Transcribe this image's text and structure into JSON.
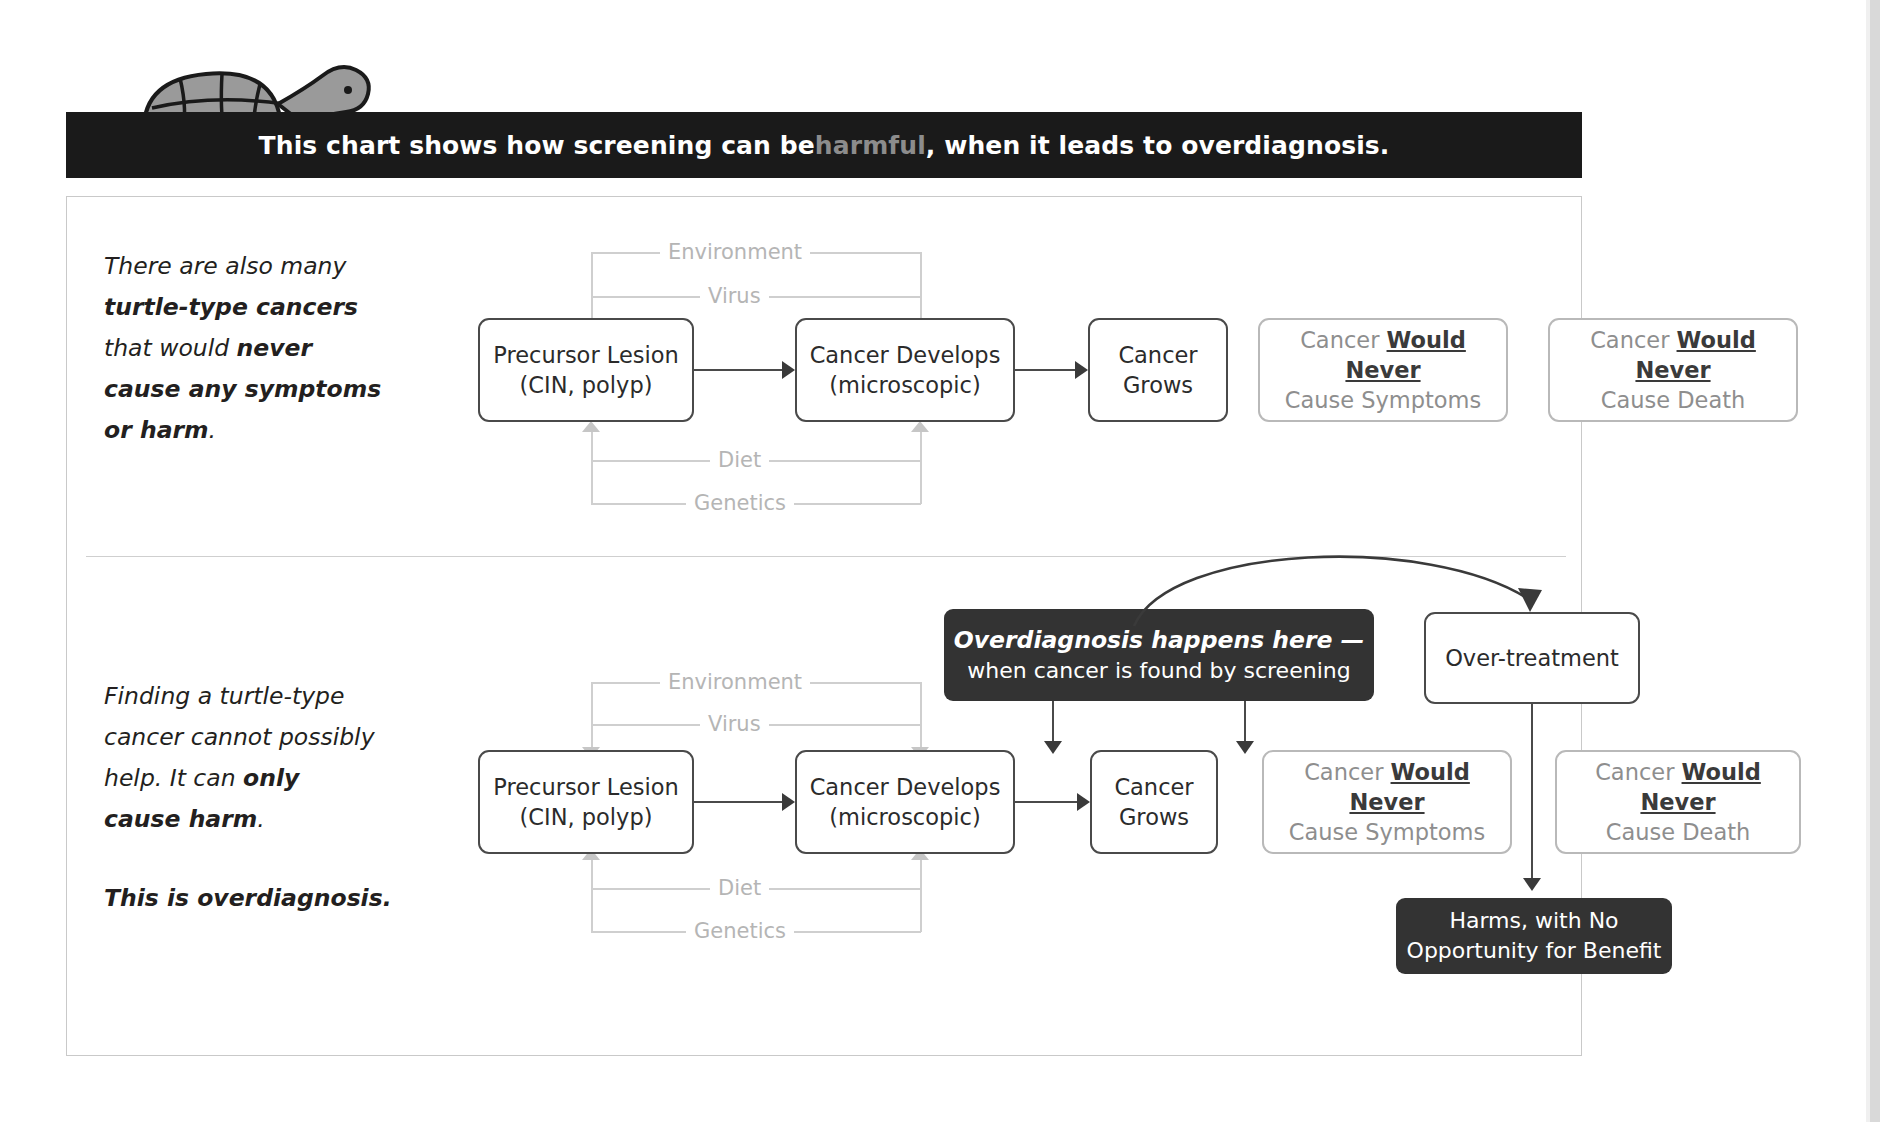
{
  "header": {
    "title_part1": "This chart shows how screening can be ",
    "title_highlight": "harmful",
    "title_part2": ", when it leads to overdiagnosis.",
    "highlight_color": "#8c8c8c",
    "bar_color": "#1a1a1a"
  },
  "mascot": {
    "name": "turtle-illustration",
    "shell_color": "#9a9a9a",
    "outline_color": "#1a1a1a"
  },
  "panels": [
    {
      "id": "top",
      "caption_lines": [
        {
          "text": "There are also many",
          "bold": false
        },
        {
          "text": "turtle-type cancers",
          "bold": true
        },
        {
          "text": "that would ",
          "bold": false,
          "tail": "never",
          "tail_bold": true
        },
        {
          "text": "cause any symptoms",
          "bold": true
        },
        {
          "text": "or harm",
          "bold": true,
          "tail": ".",
          "tail_bold": false
        }
      ],
      "factors_upper": [
        "Environment",
        "Virus"
      ],
      "factors_lower": [
        "Diet",
        "Genetics"
      ],
      "boxes": [
        {
          "name": "precursor-lesion",
          "line1": "Precursor Lesion",
          "line2": "(CIN, polyp)",
          "style": "dark-border"
        },
        {
          "name": "cancer-develops",
          "line1": "Cancer Develops",
          "line2": "(microscopic)",
          "style": "dark-border"
        },
        {
          "name": "cancer-grows",
          "line1": "Cancer",
          "line2": "Grows",
          "style": "dark-border"
        },
        {
          "name": "no-symptoms",
          "line1": "Cancer ",
          "line1_bold": "Would Never",
          "line2": "Cause Symptoms",
          "style": "light-border"
        },
        {
          "name": "no-death",
          "line1": "Cancer ",
          "line1_bold": "Would Never",
          "line2": "Cause Death",
          "style": "light-border"
        }
      ]
    },
    {
      "id": "bottom",
      "caption_lines": [
        {
          "text": "Finding a turtle-type",
          "bold": false
        },
        {
          "text": "cancer cannot possibly",
          "bold": false
        },
        {
          "text": "help. It can ",
          "bold": false,
          "tail": "only",
          "tail_bold": true
        },
        {
          "text": "cause harm",
          "bold": true,
          "tail": ".",
          "tail_bold": false
        }
      ],
      "caption_closer": "This is overdiagnosis.",
      "factors_upper": [
        "Environment",
        "Virus"
      ],
      "factors_lower": [
        "Diet",
        "Genetics"
      ],
      "boxes": [
        {
          "name": "precursor-lesion",
          "line1": "Precursor Lesion",
          "line2": "(CIN, polyp)",
          "style": "dark-border"
        },
        {
          "name": "cancer-develops",
          "line1": "Cancer Develops",
          "line2": "(microscopic)",
          "style": "dark-border"
        },
        {
          "name": "cancer-grows",
          "line1": "Cancer",
          "line2": "Grows",
          "style": "dark-border"
        },
        {
          "name": "no-symptoms",
          "line1": "Cancer ",
          "line1_bold": "Would Never",
          "line2": "Cause Symptoms",
          "style": "light-border"
        },
        {
          "name": "no-death",
          "line1": "Cancer ",
          "line1_bold": "Would Never",
          "line2": "Cause Death",
          "style": "light-border"
        }
      ],
      "callout": {
        "line1": "Overdiagnosis happens here —",
        "line2": "when cancer is found by screening",
        "background": "#333333",
        "text_color": "#ffffff"
      },
      "overtreatment_box": {
        "label": "Over-treatment"
      },
      "harms_box": {
        "line1": "Harms, with No",
        "line2": "Opportunity for Benefit",
        "background": "#333333",
        "text_color": "#ffffff"
      }
    }
  ]
}
